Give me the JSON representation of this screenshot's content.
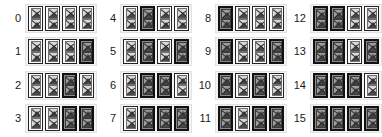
{
  "view": {
    "title": "Binary counter grid 0-15",
    "bit_count": 4,
    "icons_per_cell": 2,
    "icon_name": "broken-image-icon",
    "columns": 4,
    "rows": 4,
    "colors": {
      "background": "#ffffff",
      "label": "#1a1a1a",
      "cell_off_fill": "#fbfbfb",
      "cell_on_fill": "#8a8a8a",
      "cell_border": "#232323",
      "group_fill": "#f3f3f3"
    }
  },
  "groups": [
    {
      "label": "0",
      "bits": [
        0,
        0,
        0,
        0
      ]
    },
    {
      "label": "4",
      "bits": [
        0,
        1,
        0,
        0
      ]
    },
    {
      "label": "8",
      "bits": [
        1,
        0,
        0,
        0
      ]
    },
    {
      "label": "12",
      "bits": [
        1,
        1,
        0,
        0
      ]
    },
    {
      "label": "1",
      "bits": [
        0,
        0,
        0,
        1
      ]
    },
    {
      "label": "5",
      "bits": [
        0,
        1,
        0,
        1
      ]
    },
    {
      "label": "9",
      "bits": [
        1,
        0,
        0,
        1
      ]
    },
    {
      "label": "13",
      "bits": [
        1,
        1,
        0,
        1
      ]
    },
    {
      "label": "2",
      "bits": [
        0,
        0,
        1,
        0
      ]
    },
    {
      "label": "6",
      "bits": [
        0,
        1,
        1,
        0
      ]
    },
    {
      "label": "10",
      "bits": [
        1,
        0,
        1,
        0
      ]
    },
    {
      "label": "14",
      "bits": [
        1,
        1,
        1,
        0
      ]
    },
    {
      "label": "3",
      "bits": [
        0,
        0,
        1,
        1
      ]
    },
    {
      "label": "7",
      "bits": [
        0,
        1,
        1,
        1
      ]
    },
    {
      "label": "11",
      "bits": [
        1,
        0,
        1,
        1
      ]
    },
    {
      "label": "15",
      "bits": [
        1,
        1,
        1,
        1
      ]
    }
  ]
}
